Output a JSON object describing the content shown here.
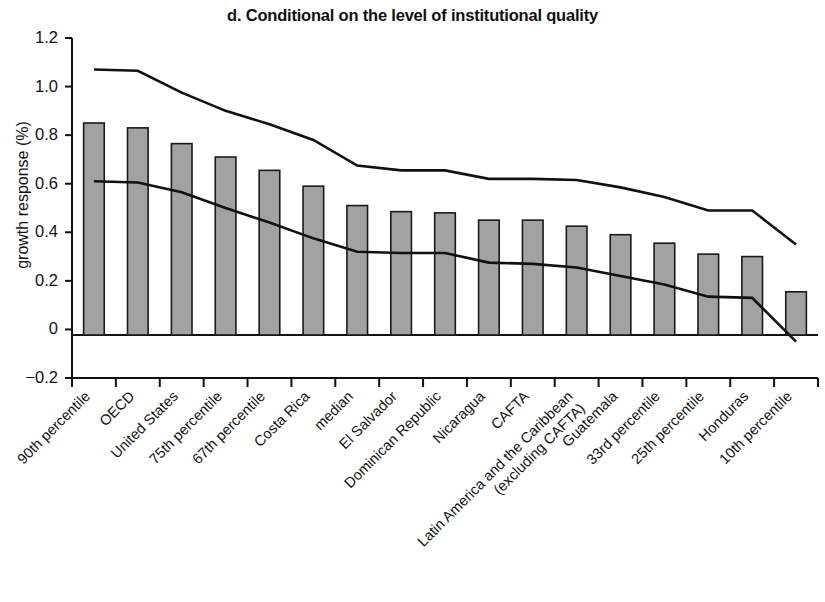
{
  "chart_data": {
    "type": "bar",
    "title": "d. Conditional on the level of institutional quality",
    "xlabel": "",
    "ylabel": "growth response (%)",
    "ylim": [
      -0.2,
      1.2
    ],
    "yticks": [
      "1.2",
      "1.0",
      "0.8",
      "0.6",
      "0.4",
      "0.2",
      "0",
      "−0.2"
    ],
    "ytick_values": [
      1.2,
      1.0,
      0.8,
      0.6,
      0.4,
      0.2,
      0,
      -0.2
    ],
    "grid": false,
    "legend": "none",
    "categories": [
      "90th percentile",
      "OECD",
      "United States",
      "75th percentile",
      "67th percentile",
      "Costa Rica",
      "median",
      "El Salvador",
      "Dominican Republic",
      "Nicaragua",
      "CAFTA",
      "Latin America and the Caribbean (excluding CAFTA)",
      "Guatemala",
      "33rd percentile",
      "25th percentile",
      "Honduras",
      "10th percentile"
    ],
    "category_lines": [
      [
        "90th percentile"
      ],
      [
        "OECD"
      ],
      [
        "United States"
      ],
      [
        "75th percentile"
      ],
      [
        "67th percentile"
      ],
      [
        "Costa Rica"
      ],
      [
        "median"
      ],
      [
        "El Salvador"
      ],
      [
        "Dominican Republic"
      ],
      [
        "Nicaragua"
      ],
      [
        "CAFTA"
      ],
      [
        "Latin America and the Caribbean",
        "(excluding CAFTA)"
      ],
      [
        "Guatemala"
      ],
      [
        "33rd percentile"
      ],
      [
        "25th percentile"
      ],
      [
        "Honduras"
      ],
      [
        "10th percentile"
      ]
    ],
    "values": [
      0.85,
      0.83,
      0.765,
      0.71,
      0.655,
      0.59,
      0.51,
      0.485,
      0.48,
      0.45,
      0.45,
      0.425,
      0.39,
      0.355,
      0.31,
      0.3,
      0.155
    ],
    "series": [
      {
        "name": "growth response",
        "type": "bar",
        "values": [
          0.85,
          0.83,
          0.765,
          0.71,
          0.655,
          0.59,
          0.51,
          0.485,
          0.48,
          0.45,
          0.45,
          0.425,
          0.39,
          0.355,
          0.31,
          0.3,
          0.155
        ]
      },
      {
        "name": "upper confidence bound",
        "type": "line",
        "values": [
          1.07,
          1.065,
          0.975,
          0.9,
          0.845,
          0.78,
          0.675,
          0.655,
          0.655,
          0.62,
          0.62,
          0.615,
          0.585,
          0.545,
          0.49,
          0.49,
          0.35
        ]
      },
      {
        "name": "lower confidence bound",
        "type": "line",
        "values": [
          0.61,
          0.605,
          0.565,
          0.5,
          0.44,
          0.375,
          0.32,
          0.315,
          0.315,
          0.275,
          0.27,
          0.255,
          0.22,
          0.185,
          0.135,
          0.13,
          -0.05
        ]
      }
    ],
    "bar_color": "#a2a2a2",
    "bar_edge_color": "#1a1a1a",
    "line_color": "#111111",
    "axis_color": "#111111"
  }
}
